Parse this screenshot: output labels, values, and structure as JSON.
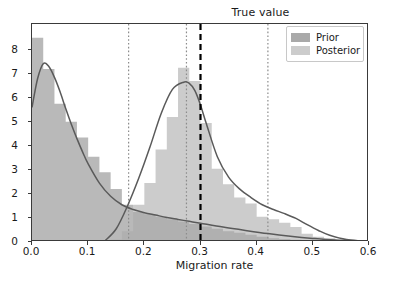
{
  "chart_data": {
    "type": "bar",
    "title": "True value",
    "xlabel": "Migration rate",
    "ylabel": "",
    "xlim": [
      0.0,
      0.6
    ],
    "ylim": [
      0.0,
      9.07
    ],
    "grid": false,
    "legend_position": "upper right",
    "xticks": [
      "0.0",
      "0.1",
      "0.2",
      "0.3",
      "0.4",
      "0.5",
      "0.6"
    ],
    "xtick_values": [
      0.0,
      0.1,
      0.2,
      0.3,
      0.4,
      0.5,
      0.6
    ],
    "yticks": [
      "0",
      "1",
      "2",
      "3",
      "4",
      "5",
      "6",
      "7",
      "8"
    ],
    "ytick_values": [
      0,
      1,
      2,
      3,
      4,
      5,
      6,
      7,
      8
    ],
    "series": [
      {
        "name": "Prior",
        "kind": "histogram",
        "color": "#a9a9a9",
        "bin_width": 0.02,
        "bin_edges": [
          0.0,
          0.02,
          0.04,
          0.06,
          0.08,
          0.1,
          0.12,
          0.14,
          0.16,
          0.18,
          0.2,
          0.22,
          0.24,
          0.26,
          0.28,
          0.3,
          0.32,
          0.34,
          0.36,
          0.38,
          0.4,
          0.42,
          0.44,
          0.46,
          0.48,
          0.5,
          0.52,
          0.54,
          0.56
        ],
        "values": [
          8.5,
          7.2,
          5.75,
          5.0,
          4.35,
          3.55,
          2.9,
          2.2,
          1.55,
          1.25,
          1.15,
          1.05,
          0.95,
          0.85,
          0.75,
          0.65,
          0.55,
          0.45,
          0.38,
          0.3,
          0.22,
          0.16,
          0.12,
          0.09,
          0.06,
          0.04,
          0.03,
          0.02
        ]
      },
      {
        "name": "Posterior",
        "kind": "histogram",
        "color": "#cccccc",
        "bin_width": 0.02,
        "bin_edges": [
          0.14,
          0.16,
          0.18,
          0.2,
          0.22,
          0.24,
          0.26,
          0.28,
          0.3,
          0.32,
          0.34,
          0.36,
          0.38,
          0.4,
          0.42,
          0.44,
          0.46,
          0.48,
          0.5,
          0.52,
          0.54,
          0.56
        ],
        "values": [
          0.1,
          0.45,
          1.55,
          2.45,
          3.85,
          5.2,
          7.25,
          6.7,
          4.95,
          3.05,
          2.4,
          1.85,
          1.6,
          1.05,
          0.95,
          0.8,
          0.62,
          0.34,
          0.22,
          0.16,
          0.1
        ]
      },
      {
        "name": "Prior KDE",
        "kind": "line",
        "color": "#5a5a5a",
        "x": [
          0.0,
          0.01,
          0.02,
          0.03,
          0.04,
          0.05,
          0.06,
          0.07,
          0.08,
          0.09,
          0.1,
          0.12,
          0.14,
          0.16,
          0.18,
          0.2,
          0.22,
          0.24,
          0.26,
          0.28,
          0.3,
          0.34,
          0.38,
          0.42,
          0.46,
          0.5,
          0.54,
          0.6
        ],
        "y": [
          5.6,
          6.8,
          7.42,
          7.3,
          6.85,
          6.25,
          5.55,
          4.9,
          4.3,
          3.75,
          3.25,
          2.45,
          1.9,
          1.55,
          1.35,
          1.22,
          1.12,
          1.02,
          0.94,
          0.86,
          0.78,
          0.62,
          0.48,
          0.35,
          0.24,
          0.15,
          0.08,
          0.02
        ]
      },
      {
        "name": "Posterior KDE",
        "kind": "line",
        "color": "#5a5a5a",
        "x": [
          0.13,
          0.15,
          0.17,
          0.19,
          0.21,
          0.23,
          0.25,
          0.27,
          0.28,
          0.29,
          0.3,
          0.31,
          0.33,
          0.35,
          0.37,
          0.39,
          0.41,
          0.43,
          0.45,
          0.47,
          0.49,
          0.51,
          0.53,
          0.56,
          0.6
        ],
        "y": [
          0.05,
          0.55,
          1.5,
          2.65,
          3.95,
          5.35,
          6.35,
          6.65,
          6.6,
          6.3,
          5.7,
          4.95,
          3.55,
          2.7,
          2.2,
          1.85,
          1.55,
          1.35,
          1.18,
          0.98,
          0.72,
          0.48,
          0.28,
          0.1,
          0.02
        ]
      }
    ],
    "annotations": [
      {
        "name": "true-value-line",
        "type": "vline",
        "x": 0.3,
        "style": "dashed",
        "color": "#000000",
        "width": 2.2,
        "label": "True value"
      },
      {
        "name": "interval-line-lower",
        "type": "vline",
        "x": 0.172,
        "style": "dotted",
        "color": "#8c8c8c",
        "width": 1.2
      },
      {
        "name": "interval-line-median",
        "type": "vline",
        "x": 0.275,
        "style": "dotted",
        "color": "#8c8c8c",
        "width": 1.2
      },
      {
        "name": "interval-line-upper",
        "type": "vline",
        "x": 0.42,
        "style": "dotted",
        "color": "#8c8c8c",
        "width": 1.2
      }
    ],
    "legend_entries": [
      {
        "label": "Prior",
        "color": "#a9a9a9"
      },
      {
        "label": "Posterior",
        "color": "#cccccc"
      }
    ]
  }
}
